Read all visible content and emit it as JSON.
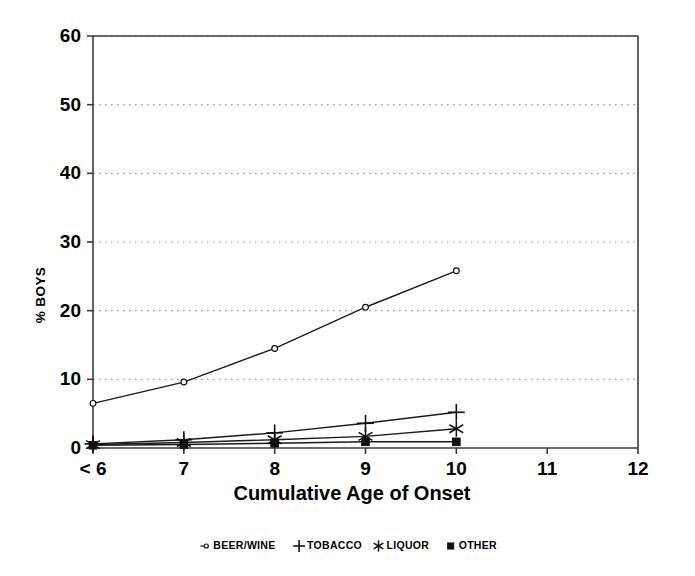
{
  "chart_data": {
    "type": "line",
    "title": "",
    "xlabel": "Cumulative Age of Onset",
    "ylabel": "% BOYS",
    "x": [
      "< 6",
      "7",
      "8",
      "9",
      "10",
      "11",
      "12"
    ],
    "categories": [
      "< 6",
      "7",
      "8",
      "9",
      "10"
    ],
    "xlim": [
      0,
      6
    ],
    "ylim": [
      0,
      60
    ],
    "yticks": [
      0,
      10,
      20,
      30,
      40,
      50,
      60
    ],
    "xticks": [
      "< 6",
      "7",
      "8",
      "9",
      "10",
      "11",
      "12"
    ],
    "grid": "horizontal-dotted",
    "legend_position": "below-plot",
    "series": [
      {
        "name": "BEER/WINE",
        "marker": "open-circle",
        "values": [
          6.5,
          9.6,
          14.5,
          20.5,
          25.8
        ]
      },
      {
        "name": "TOBACCO",
        "marker": "plus",
        "values": [
          0.6,
          1.2,
          2.2,
          3.6,
          5.2
        ]
      },
      {
        "name": "LIQUOR",
        "marker": "asterisk",
        "values": [
          0.5,
          0.8,
          1.2,
          1.7,
          2.8
        ]
      },
      {
        "name": "OTHER",
        "marker": "filled-square",
        "values": [
          0.4,
          0.5,
          0.7,
          0.9,
          0.9
        ]
      }
    ]
  },
  "axes": {
    "y_label": "% BOYS",
    "x_label": "Cumulative Age of Onset",
    "y_tick_labels": [
      "0",
      "10",
      "20",
      "30",
      "40",
      "50",
      "60"
    ],
    "x_tick_labels": [
      "< 6",
      "7",
      "8",
      "9",
      "10",
      "11",
      "12"
    ]
  },
  "legend": {
    "items": [
      {
        "label": "BEER/WINE",
        "marker": "open-circle"
      },
      {
        "label": "TOBACCO",
        "marker": "plus"
      },
      {
        "label": "LIQUOR",
        "marker": "asterisk"
      },
      {
        "label": "OTHER",
        "marker": "filled-square"
      }
    ]
  },
  "colors": {
    "line": "#1a1a1a",
    "axis": "#3b3b3b",
    "grid": "#9a9a9a",
    "background": "#ffffff"
  }
}
